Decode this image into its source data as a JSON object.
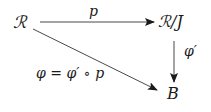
{
  "diagram": {
    "type": "commutative-diagram",
    "nodes": {
      "source": "ℛ",
      "quotient": "ℛ/J",
      "target": "B"
    },
    "arrows": {
      "projection": {
        "label": "p",
        "from": "source",
        "to": "quotient"
      },
      "induced": {
        "label": "φ′",
        "from": "quotient",
        "to": "target"
      },
      "composite": {
        "label": "φ = φ′ ∘ p",
        "from": "source",
        "to": "target"
      }
    },
    "colors": {
      "ink": "#1a1a1a",
      "background": "#ffffff"
    }
  }
}
